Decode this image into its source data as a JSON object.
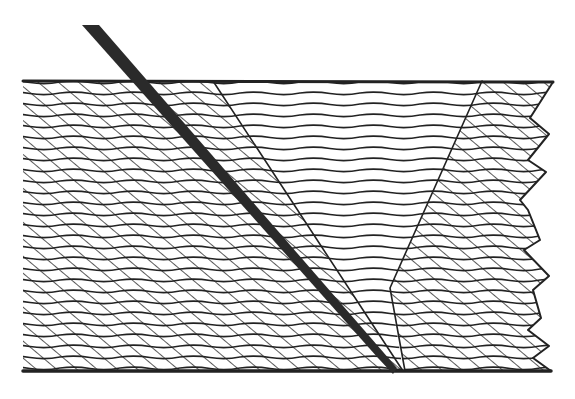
{
  "figure": {
    "colors": {
      "ink": "#222222",
      "background": "#ffffff",
      "blade": "#2a2a2a"
    },
    "block": {
      "top_y": 81,
      "bottom_y": 371,
      "left_x": 23
    },
    "blade": {
      "top": [
        [
          82,
          25
        ],
        [
          99,
          25
        ]
      ],
      "tip": [
        393,
        372
      ]
    },
    "wedge_left_line": [
      [
        213,
        81
      ],
      [
        403,
        371
      ]
    ],
    "wedge_right_line": [
      [
        482,
        81
      ],
      [
        390,
        288
      ],
      [
        405,
        371
      ]
    ],
    "jagged_edge": [
      [
        553,
        82
      ],
      [
        530,
        118
      ],
      [
        549,
        134
      ],
      [
        528,
        160
      ],
      [
        546,
        172
      ],
      [
        520,
        200
      ],
      [
        528,
        210
      ],
      [
        540,
        240
      ],
      [
        524,
        250
      ],
      [
        549,
        276
      ],
      [
        533,
        290
      ],
      [
        541,
        318
      ],
      [
        528,
        330
      ],
      [
        549,
        346
      ],
      [
        533,
        358
      ],
      [
        551,
        371
      ]
    ]
  }
}
